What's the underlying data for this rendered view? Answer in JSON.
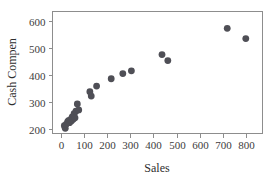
{
  "chart_data": {
    "type": "scatter",
    "title": "",
    "xlabel": "Sales",
    "ylabel": "Cash Compen",
    "xlim": [
      -35,
      870
    ],
    "ylim": [
      185,
      635
    ],
    "xticks": [
      0,
      100,
      200,
      300,
      400,
      500,
      600,
      700,
      800
    ],
    "yticks": [
      200,
      300,
      400,
      500,
      600
    ],
    "grid": false,
    "legend": null,
    "marker": {
      "shape": "circle",
      "color": "#4f4f56",
      "size": 3.4
    },
    "points": [
      {
        "x": 16,
        "y": 214
      },
      {
        "x": 20,
        "y": 204
      },
      {
        "x": 24,
        "y": 219
      },
      {
        "x": 30,
        "y": 228
      },
      {
        "x": 34,
        "y": 232
      },
      {
        "x": 38,
        "y": 225
      },
      {
        "x": 42,
        "y": 236
      },
      {
        "x": 46,
        "y": 231
      },
      {
        "x": 50,
        "y": 246
      },
      {
        "x": 54,
        "y": 238
      },
      {
        "x": 58,
        "y": 258
      },
      {
        "x": 62,
        "y": 243
      },
      {
        "x": 66,
        "y": 267
      },
      {
        "x": 72,
        "y": 294
      },
      {
        "x": 78,
        "y": 272
      },
      {
        "x": 126,
        "y": 339
      },
      {
        "x": 132,
        "y": 323
      },
      {
        "x": 155,
        "y": 360
      },
      {
        "x": 218,
        "y": 387
      },
      {
        "x": 268,
        "y": 406
      },
      {
        "x": 305,
        "y": 416
      },
      {
        "x": 437,
        "y": 476
      },
      {
        "x": 462,
        "y": 454
      },
      {
        "x": 718,
        "y": 573
      },
      {
        "x": 798,
        "y": 535
      }
    ]
  }
}
